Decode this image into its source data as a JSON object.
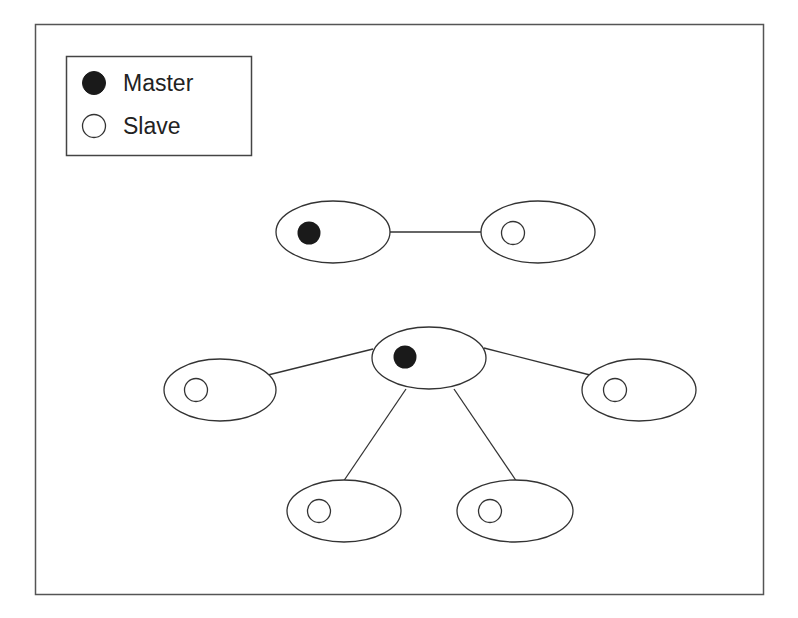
{
  "legend": {
    "items": [
      {
        "label": "Master",
        "symbol": "filled-circle"
      },
      {
        "label": "Slave",
        "symbol": "hollow-circle"
      }
    ]
  },
  "diagram": {
    "colors": {
      "stroke": "#333333",
      "master_fill": "#1a1a1a",
      "slave_fill": "#ffffff"
    },
    "topologies": [
      {
        "name": "point-to-point",
        "nodes": [
          {
            "id": "p2p-master",
            "role": "Master"
          },
          {
            "id": "p2p-slave",
            "role": "Slave"
          }
        ],
        "links": [
          [
            "p2p-master",
            "p2p-slave"
          ]
        ]
      },
      {
        "name": "star",
        "nodes": [
          {
            "id": "star-master",
            "role": "Master"
          },
          {
            "id": "star-slave-left",
            "role": "Slave"
          },
          {
            "id": "star-slave-right",
            "role": "Slave"
          },
          {
            "id": "star-slave-bottom-left",
            "role": "Slave"
          },
          {
            "id": "star-slave-bottom-right",
            "role": "Slave"
          }
        ],
        "links": [
          [
            "star-master",
            "star-slave-left"
          ],
          [
            "star-master",
            "star-slave-right"
          ],
          [
            "star-master",
            "star-slave-bottom-left"
          ],
          [
            "star-master",
            "star-slave-bottom-right"
          ]
        ]
      }
    ]
  }
}
